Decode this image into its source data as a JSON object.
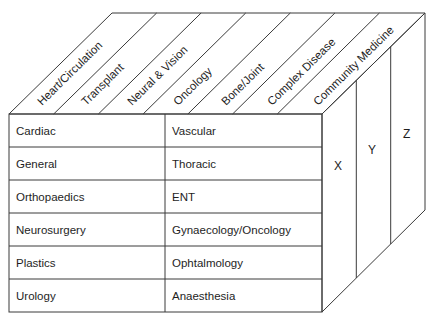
{
  "diagram": {
    "type": "3d-cube-matrix",
    "top_face_labels": [
      "Heart/Circulation",
      "Transplant",
      "Neural & Vision",
      "Oncology",
      "Bone/Joint",
      "Complex Disease",
      "Community Medicine"
    ],
    "front_face": {
      "rows": [
        {
          "left": "Cardiac",
          "right": "Vascular"
        },
        {
          "left": "General",
          "right": "Thoracic"
        },
        {
          "left": "Orthopaedics",
          "right": "ENT"
        },
        {
          "left": "Neurosurgery",
          "right": "Gynaecology/Oncology"
        },
        {
          "left": "Plastics",
          "right": "Ophtalmology"
        },
        {
          "left": "Urology",
          "right": "Anaesthesia"
        }
      ]
    },
    "side_face_labels": [
      "X",
      "Y",
      "Z"
    ],
    "line_color": "#3a3a3a",
    "background": "#ffffff"
  }
}
